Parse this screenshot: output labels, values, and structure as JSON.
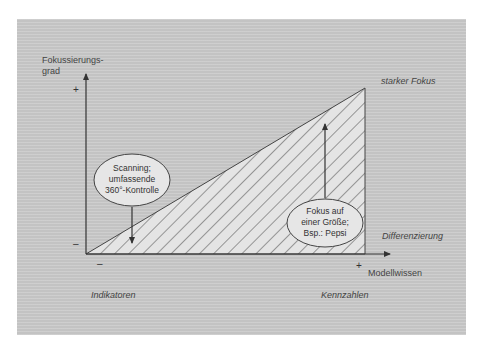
{
  "diagram": {
    "y_axis": {
      "label_line1": "Fokussierungs-",
      "label_line2": "grad",
      "plus": "+",
      "minus": "–"
    },
    "x_axis": {
      "label": "Modellwissen",
      "plus": "+",
      "minus": "–"
    },
    "corner_labels": {
      "top_right": "starker Fokus",
      "right": "Differenzierung",
      "bottom_left": "Indikatoren",
      "bottom_right": "Kennzahlen"
    },
    "bubbles": [
      {
        "lines": [
          "Scanning;",
          "umfassende",
          "360°-Kontrolle"
        ],
        "arrow": "down"
      },
      {
        "lines": [
          "Fokus auf",
          "einer Größe;",
          "Bsp.: Pepsi"
        ],
        "arrow": "up"
      }
    ],
    "colors": {
      "panel": "#c9c9c9",
      "triangle_fill": "#e4e4e4",
      "line": "#333333"
    }
  }
}
